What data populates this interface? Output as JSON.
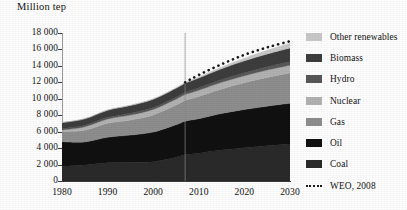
{
  "figure": {
    "axis_caption": "Million tep",
    "source_note": "WEO, 2008"
  },
  "legend": {
    "items": [
      {
        "label": "Other renewables",
        "color": "#c9c9c9",
        "swatch": "block"
      },
      {
        "label": "Biomass",
        "color": "#3d3d3d",
        "swatch": "block"
      },
      {
        "label": "Hydro",
        "color": "#585858",
        "swatch": "block"
      },
      {
        "label": "Nuclear",
        "color": "#b2b2b2",
        "swatch": "block"
      },
      {
        "label": "Gas",
        "color": "#8e8e8e",
        "swatch": "block"
      },
      {
        "label": "Oil",
        "color": "#111111",
        "swatch": "block"
      },
      {
        "label": "Coal",
        "color": "#2a2a2a",
        "swatch": "block"
      },
      {
        "label": "WEO, 2008",
        "color": "#1a1a1a",
        "swatch": "dotted-line"
      }
    ]
  },
  "chart_data": {
    "type": "area",
    "stacked": true,
    "title": "",
    "xlabel": "",
    "ylabel": "Million tep",
    "xlim": [
      1980,
      2030
    ],
    "ylim": [
      0,
      18000
    ],
    "ytick_step": 2000,
    "grid": false,
    "legend_position": "right",
    "xticks": [
      1980,
      1990,
      2000,
      2010,
      2020,
      2030
    ],
    "xtick_labels": [
      "1980",
      "1990",
      "2000",
      "2010",
      "2020",
      "2030"
    ],
    "yticks": [
      0,
      2000,
      4000,
      6000,
      8000,
      10000,
      12000,
      14000,
      16000,
      18000
    ],
    "ytick_labels": [
      "0",
      "2 000",
      "4 000",
      "6 000",
      "8 000",
      "10 000",
      "12 000",
      "14 000",
      "16 000",
      "18 000"
    ],
    "x": [
      1980,
      1985,
      1990,
      1995,
      2000,
      2005,
      2007,
      2010,
      2015,
      2020,
      2025,
      2030
    ],
    "projection_start_year": 2007,
    "series": [
      {
        "name": "Coal",
        "color": "#2a2a2a",
        "values": [
          1800,
          1950,
          2230,
          2280,
          2350,
          2900,
          3180,
          3380,
          3760,
          4050,
          4300,
          4500
        ]
      },
      {
        "name": "Oil",
        "color": "#111111",
        "values": [
          2970,
          2800,
          3100,
          3300,
          3600,
          3950,
          4100,
          4200,
          4450,
          4650,
          4800,
          4950
        ]
      },
      {
        "name": "Gas",
        "color": "#8e8e8e",
        "values": [
          1240,
          1420,
          1680,
          1840,
          2080,
          2380,
          2520,
          2700,
          2980,
          3250,
          3500,
          3700
        ]
      },
      {
        "name": "Nuclear",
        "color": "#b2b2b2",
        "values": [
          190,
          420,
          530,
          610,
          680,
          720,
          710,
          760,
          810,
          860,
          900,
          930
        ]
      },
      {
        "name": "Hydro",
        "color": "#585858",
        "values": [
          150,
          180,
          200,
          225,
          230,
          250,
          260,
          290,
          330,
          370,
          410,
          450
        ]
      },
      {
        "name": "Biomass",
        "color": "#3d3d3d",
        "values": [
          740,
          790,
          860,
          920,
          1000,
          1080,
          1120,
          1200,
          1320,
          1430,
          1540,
          1650
        ]
      },
      {
        "name": "Other renewables",
        "color": "#c9c9c9",
        "values": [
          12,
          20,
          36,
          52,
          60,
          75,
          85,
          130,
          220,
          330,
          450,
          580
        ]
      }
    ],
    "projection_line": {
      "name": "WEO, 2008",
      "style": "dotted",
      "color": "#1a1a1a",
      "x": [
        2007,
        2010,
        2015,
        2020,
        2025,
        2030
      ],
      "values": [
        12000,
        12900,
        14200,
        15350,
        16250,
        17000
      ]
    }
  }
}
